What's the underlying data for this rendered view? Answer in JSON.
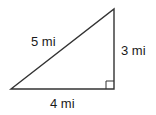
{
  "diagram": {
    "type": "right-triangle",
    "hypotenuse_label": "5 mi",
    "vertical_leg_label": "3 mi",
    "horizontal_leg_label": "4 mi",
    "right_angle_marker": true,
    "stroke_color": "#333333"
  }
}
